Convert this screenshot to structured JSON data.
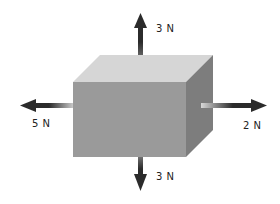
{
  "diagram": {
    "object": "block",
    "colors": {
      "front_face": "#9a9a9a",
      "top_face": "#d6d6d6",
      "side_face": "#7d7d7d",
      "arrow_dark": "#2b2b2b",
      "arrow_light": "#d0d0d0",
      "label": "#222222"
    },
    "forces": [
      {
        "direction": "up",
        "label": "3 N",
        "magnitude": 3,
        "unit": "N"
      },
      {
        "direction": "down",
        "label": "3 N",
        "magnitude": 3,
        "unit": "N"
      },
      {
        "direction": "left",
        "label": "5 N",
        "magnitude": 5,
        "unit": "N"
      },
      {
        "direction": "right",
        "label": "2 N",
        "magnitude": 2,
        "unit": "N"
      }
    ]
  }
}
